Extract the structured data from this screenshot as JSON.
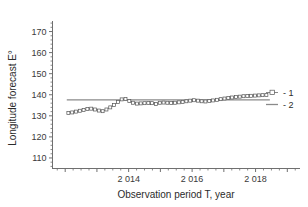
{
  "chart_data": {
    "type": "line",
    "title": "",
    "xlabel": "Observation period T, year",
    "ylabel": "Longitude forecast E°",
    "xlim": [
      2011.6,
      2019.4
    ],
    "ylim": [
      105.0,
      175.0
    ],
    "grid": false,
    "legend_position": "right",
    "y_ticks": [
      110,
      120,
      130,
      140,
      150,
      160,
      170
    ],
    "y_ticklabels": [
      "110",
      "120",
      "130",
      "140",
      "150",
      "160",
      "170"
    ],
    "y_minor_tick_step": 2,
    "x_ticks": [
      2012,
      2013,
      2014,
      2015,
      2016,
      2017,
      2018,
      2019
    ],
    "x_ticklabels": [
      "",
      "",
      "2 014",
      "",
      "2 016",
      "",
      "2 018",
      ""
    ],
    "x_minor_tick_step": 0.25,
    "series": [
      {
        "name": "1",
        "legend_label": "- 1",
        "style": "line-with-square-markers",
        "color": "#7a7a7a",
        "marker": "open-square",
        "x": [
          2012.1,
          2012.22,
          2012.34,
          2012.46,
          2012.58,
          2012.7,
          2012.82,
          2012.94,
          2013.06,
          2013.18,
          2013.3,
          2013.42,
          2013.54,
          2013.66,
          2013.78,
          2013.9,
          2014.02,
          2014.14,
          2014.26,
          2014.38,
          2014.5,
          2014.62,
          2014.74,
          2014.86,
          2014.98,
          2015.1,
          2015.22,
          2015.34,
          2015.46,
          2015.58,
          2015.7,
          2015.82,
          2015.94,
          2016.06,
          2016.18,
          2016.3,
          2016.42,
          2016.54,
          2016.66,
          2016.78,
          2016.9,
          2017.02,
          2017.14,
          2017.26,
          2017.38,
          2017.5,
          2017.62,
          2017.74,
          2017.86,
          2017.98,
          2018.1,
          2018.22,
          2018.34
        ],
        "y": [
          131.4,
          131.6,
          132.0,
          132.4,
          132.8,
          133.2,
          133.4,
          133.0,
          132.5,
          132.2,
          133.0,
          134.0,
          135.2,
          136.6,
          137.8,
          138.0,
          137.0,
          136.2,
          135.8,
          135.9,
          136.0,
          136.1,
          136.0,
          135.6,
          136.2,
          136.3,
          136.2,
          136.1,
          136.2,
          136.4,
          136.6,
          136.9,
          137.2,
          137.4,
          137.2,
          136.9,
          136.8,
          137.0,
          137.3,
          137.6,
          137.9,
          138.2,
          138.5,
          138.7,
          138.9,
          139.1,
          139.3,
          139.4,
          139.5,
          139.6,
          139.7,
          139.8,
          139.9
        ]
      },
      {
        "name": "2",
        "legend_label": "- 2",
        "style": "solid-line",
        "color": "#8a8a8a",
        "marker": "none",
        "x": [
          2012.05,
          2018.45
        ],
        "y": [
          137.6,
          137.6
        ]
      }
    ]
  },
  "legend": {
    "entries": [
      {
        "label": "- 1"
      },
      {
        "label": "- 2"
      }
    ]
  },
  "axes": {
    "y_title": "Longitude forecast E°",
    "x_title": "Observation period T, year"
  }
}
